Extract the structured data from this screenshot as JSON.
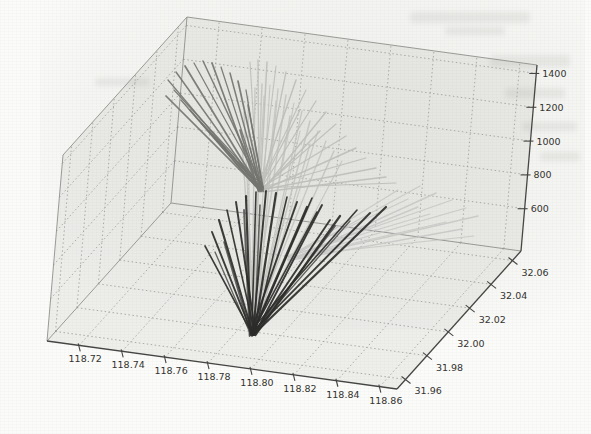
{
  "figure": {
    "kind": "scanned 3D matplotlib-style line figure",
    "background_color": "#fbfbf9",
    "pane_fill": "rgba(125,125,118,0.10)",
    "grid_color": "#a3a3a0",
    "spine_color": "#454543",
    "label_color": "#33332f"
  },
  "chart_data": {
    "type": "line",
    "projection": "3d",
    "title": "",
    "xlabel": "",
    "ylabel": "",
    "zlabel": "",
    "grid": true,
    "axes": {
      "x": {
        "range": [
          118.705,
          118.868
        ],
        "tick_values": [
          118.72,
          118.74,
          118.76,
          118.78,
          118.8,
          118.82,
          118.84,
          118.86
        ],
        "tick_labels": [
          "118.72",
          "118.74",
          "118.76",
          "118.78",
          "118.80",
          "118.82",
          "118.84",
          "118.86"
        ]
      },
      "y": {
        "range": [
          31.952,
          32.068
        ],
        "tick_values": [
          31.96,
          31.98,
          32.0,
          32.02,
          32.04,
          32.06
        ],
        "tick_labels": [
          "31.96",
          "31.98",
          "32.00",
          "32.02",
          "32.04",
          "32.06"
        ]
      },
      "z": {
        "range": [
          350,
          1450
        ],
        "tick_values": [
          600,
          800,
          1000,
          1200,
          1400
        ],
        "tick_labels": [
          "600",
          "800",
          "1000",
          "1200",
          "1400"
        ]
      }
    },
    "series": [
      {
        "name": "light-right-fan",
        "color": "#c8c8c5",
        "width": 1.2,
        "origin_px": [
          290,
          258
        ],
        "tips_px": [
          [
            408,
            199
          ],
          [
            420,
            186
          ],
          [
            436,
            193
          ],
          [
            452,
            200
          ],
          [
            466,
            208
          ],
          [
            478,
            216
          ],
          [
            430,
            214
          ],
          [
            446,
            222
          ],
          [
            462,
            229
          ],
          [
            474,
            236
          ],
          [
            398,
            190
          ],
          [
            418,
            207
          ]
        ]
      },
      {
        "name": "light-trunk-fan",
        "color": "#c3c3c0",
        "width": 1.3,
        "origin_px": [
          253,
          332
        ],
        "tips_px": [
          [
            248,
            96
          ],
          [
            255,
            88
          ],
          [
            262,
            84
          ],
          [
            270,
            85
          ],
          [
            278,
            89
          ],
          [
            286,
            95
          ],
          [
            294,
            103
          ],
          [
            302,
            111
          ],
          [
            310,
            121
          ],
          [
            318,
            131
          ],
          [
            326,
            141
          ],
          [
            334,
            151
          ],
          [
            342,
            161
          ],
          [
            244,
            112
          ],
          [
            241,
            130
          ],
          [
            264,
            96
          ],
          [
            276,
            101
          ],
          [
            290,
            116
          ],
          [
            300,
            131
          ],
          [
            310,
            144
          ]
        ]
      },
      {
        "name": "light-upright-fan",
        "color": "#bdbdba",
        "width": 1.3,
        "origin_px": [
          260,
          190
        ],
        "tips_px": [
          [
            250,
            62
          ],
          [
            258,
            60
          ],
          [
            267,
            62
          ],
          [
            276,
            66
          ],
          [
            286,
            72
          ],
          [
            296,
            80
          ],
          [
            306,
            90
          ],
          [
            316,
            101
          ],
          [
            326,
            112
          ],
          [
            336,
            124
          ],
          [
            346,
            136
          ],
          [
            356,
            148
          ],
          [
            366,
            158
          ],
          [
            376,
            168
          ],
          [
            386,
            177
          ],
          [
            396,
            183
          ],
          [
            300,
            110
          ],
          [
            320,
            131
          ]
        ]
      },
      {
        "name": "gray-upleft-fan",
        "color": "#747470",
        "width": 1.5,
        "origin_px": [
          261,
          189
        ],
        "tips_px": [
          [
            168,
            80
          ],
          [
            176,
            72
          ],
          [
            185,
            66
          ],
          [
            194,
            63
          ],
          [
            203,
            61
          ],
          [
            212,
            63
          ],
          [
            221,
            67
          ],
          [
            230,
            73
          ],
          [
            238,
            81
          ],
          [
            174,
            90
          ],
          [
            181,
            100
          ],
          [
            190,
            110
          ],
          [
            199,
            120
          ],
          [
            209,
            131
          ],
          [
            219,
            142
          ],
          [
            229,
            152
          ],
          [
            239,
            161
          ],
          [
            166,
            96
          ],
          [
            246,
            90
          ],
          [
            248,
            105
          ],
          [
            240,
            130
          ],
          [
            250,
            148
          ]
        ]
      },
      {
        "name": "mid-dark-strands",
        "color": "#565654",
        "width": 1.6,
        "origin_px": [
          252,
          334
        ],
        "tips_px": [
          [
            215,
            252
          ],
          [
            224,
            242
          ],
          [
            335,
            226
          ],
          [
            350,
            221
          ],
          [
            260,
            205
          ],
          [
            244,
            210
          ]
        ]
      },
      {
        "name": "dark-fan",
        "color": "#2c2c2a",
        "width": 1.9,
        "origin_px": [
          253,
          333
        ],
        "tips_px": [
          [
            205,
            246
          ],
          [
            212,
            232
          ],
          [
            219,
            220
          ],
          [
            227,
            210
          ],
          [
            236,
            202
          ],
          [
            246,
            196
          ],
          [
            256,
            192
          ],
          [
            266,
            191
          ],
          [
            276,
            193
          ],
          [
            287,
            197
          ],
          [
            297,
            202
          ],
          [
            307,
            207
          ],
          [
            317,
            212
          ],
          [
            330,
            220
          ],
          [
            340,
            216
          ],
          [
            357,
            210
          ],
          [
            370,
            213
          ],
          [
            386,
            207
          ],
          [
            312,
            198
          ],
          [
            322,
            205
          ]
        ]
      }
    ]
  }
}
